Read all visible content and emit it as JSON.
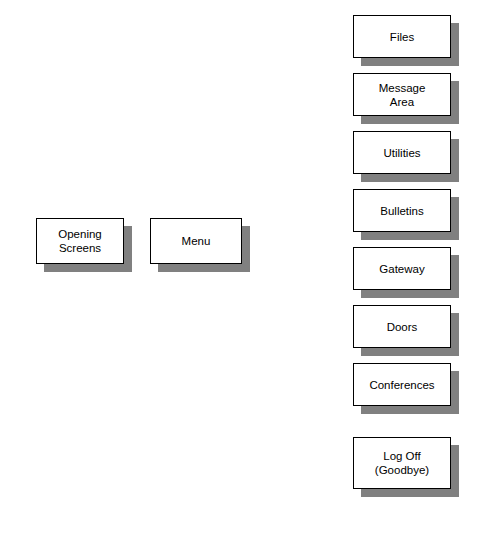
{
  "diagram": {
    "background_color": "#ffffff",
    "box_fill_color": "#ffffff",
    "box_border_color": "#000000",
    "shadow_color": "#808080",
    "text_color": "#000000",
    "left_column": [
      {
        "id": "opening-screens",
        "label": "Opening\nScreens",
        "x": 36,
        "y": 218,
        "w": 88,
        "h": 46
      },
      {
        "id": "menu",
        "label": "Menu",
        "x": 150,
        "y": 218,
        "w": 92,
        "h": 46
      }
    ],
    "menu_items": [
      {
        "id": "files",
        "label": "Files",
        "x": 353,
        "y": 15,
        "w": 98,
        "h": 43
      },
      {
        "id": "message-area",
        "label": "Message\nArea",
        "x": 353,
        "y": 73,
        "w": 98,
        "h": 43
      },
      {
        "id": "utilities",
        "label": "Utilities",
        "x": 353,
        "y": 131,
        "w": 98,
        "h": 43
      },
      {
        "id": "bulletins",
        "label": "Bulletins",
        "x": 353,
        "y": 189,
        "w": 98,
        "h": 43
      },
      {
        "id": "gateway",
        "label": "Gateway",
        "x": 353,
        "y": 247,
        "w": 98,
        "h": 43
      },
      {
        "id": "doors",
        "label": "Doors",
        "x": 353,
        "y": 305,
        "w": 98,
        "h": 43
      },
      {
        "id": "conferences",
        "label": "Conferences",
        "x": 353,
        "y": 363,
        "w": 98,
        "h": 43
      },
      {
        "id": "log-off",
        "label": "Log Off\n(Goodbye)",
        "x": 353,
        "y": 437,
        "w": 98,
        "h": 52
      }
    ]
  }
}
